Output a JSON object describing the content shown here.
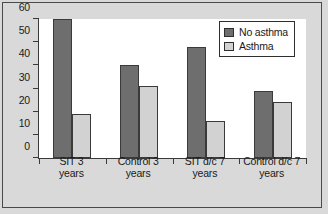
{
  "chart_data": {
    "type": "bar",
    "title": "",
    "xlabel": "",
    "ylabel": "",
    "ylim": [
      0,
      60
    ],
    "yticks": [
      0,
      10,
      20,
      30,
      40,
      50,
      60
    ],
    "grid": false,
    "legend_position": "top-right",
    "categories": [
      "SIT 3 years",
      "Control 3 years",
      "SIT d/c 7 years",
      "Control d/c 7 years"
    ],
    "category_lines": [
      [
        "SIT 3",
        "years"
      ],
      [
        "Control 3",
        "years"
      ],
      [
        "SIT d/c 7",
        "years"
      ],
      [
        "Control d/c 7",
        "years"
      ]
    ],
    "series": [
      {
        "name": "No asthma",
        "color": "#6e6e6e",
        "values": [
          60,
          40,
          48,
          29
        ]
      },
      {
        "name": "Asthma",
        "color": "#d2d2d2",
        "values": [
          19,
          31,
          16,
          24
        ]
      }
    ]
  }
}
